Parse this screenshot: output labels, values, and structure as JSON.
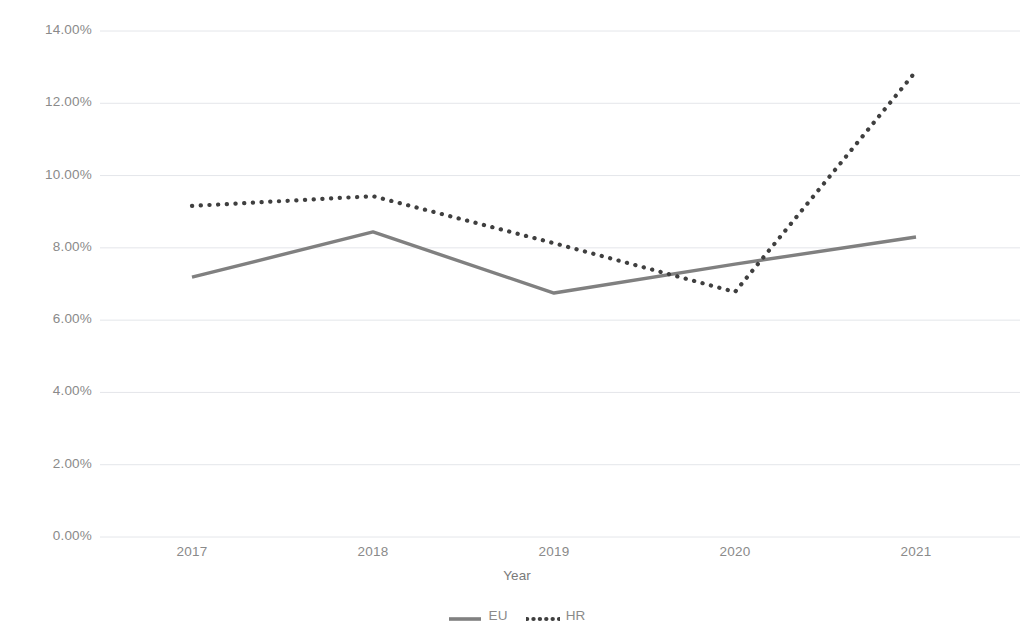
{
  "chart_data": {
    "type": "line",
    "title": "",
    "xlabel": "Year",
    "ylabel": "Relative change in DESI index",
    "categories": [
      "2017",
      "2018",
      "2019",
      "2020",
      "2021"
    ],
    "x": [
      2017,
      2018,
      2019,
      2020,
      2021
    ],
    "series": [
      {
        "name": "EU",
        "style": "solid",
        "color": "#808080",
        "values": [
          7.19,
          8.44,
          6.75,
          7.55,
          8.3
        ]
      },
      {
        "name": "HR",
        "style": "dotted",
        "color": "#3f3f3f",
        "values": [
          9.16,
          9.43,
          8.13,
          6.78,
          12.89
        ]
      }
    ],
    "ylim": [
      0,
      14
    ],
    "ytick_values": [
      0,
      2,
      4,
      6,
      8,
      10,
      12,
      14
    ],
    "ytick_labels": [
      "0.00%",
      "2.00%",
      "4.00%",
      "6.00%",
      "8.00%",
      "10.00%",
      "12.00%",
      "14.00%"
    ],
    "grid": true,
    "grid_axis": "y",
    "grid_color": "#e4e6ea",
    "legend_position": "bottom",
    "legend_entries": [
      "EU",
      "HR"
    ],
    "value_format": "percent"
  },
  "axes": {
    "y_title": "Relative change in DESI index",
    "x_title": "Year"
  },
  "legend": {
    "items": [
      {
        "label": "EU",
        "marker": "solid-line-swatch"
      },
      {
        "label": "HR",
        "marker": "dotted-line-swatch"
      }
    ]
  }
}
